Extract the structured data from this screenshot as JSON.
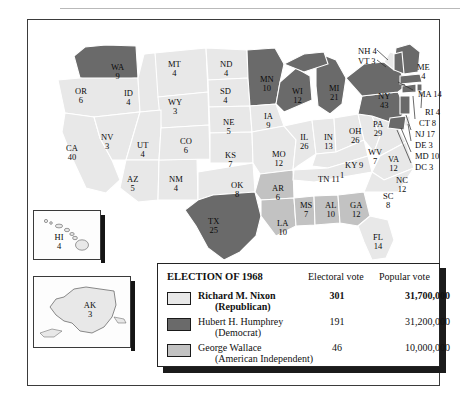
{
  "figure": {
    "frame_label": "election-map-1968"
  },
  "legend": {
    "title": "ELECTION OF 1968",
    "col_electoral": "Electoral vote",
    "col_popular": "Popular vote",
    "rows": [
      {
        "candidate": "Richard M. Nixon",
        "party": "(Republican)",
        "electoral": "301",
        "popular": "31,700,000",
        "color": "#e8e8e8",
        "bold": true
      },
      {
        "candidate": "Hubert H. Humphrey",
        "party": "(Democrat)",
        "electoral": "191",
        "popular": "31,200,000",
        "color": "#6a6a6a",
        "bold": false
      },
      {
        "candidate": "George Wallace",
        "party": "(American Independent)",
        "electoral": "46",
        "popular": "10,000,000",
        "color": "#c2c2c2",
        "bold": false
      }
    ]
  },
  "colors": {
    "nixon": "#e8e8e8",
    "humphrey": "#6a6a6a",
    "wallace": "#c2c2c2",
    "border": "#ffffff",
    "outline": "#2a2a2a"
  },
  "chart_data": {
    "type": "map",
    "title": "ELECTION OF 1968",
    "subtitle": "United States presidential election results by state",
    "legend_position": "bottom",
    "categories": [
      "Richard M. Nixon (Republican)",
      "Hubert H. Humphrey (Democrat)",
      "George Wallace (American Independent)"
    ],
    "totals": {
      "electoral": {
        "Nixon": 301,
        "Humphrey": 191,
        "Wallace": 46
      },
      "popular": {
        "Nixon": 31700000,
        "Humphrey": 31200000,
        "Wallace": 10000000
      }
    },
    "note_label": "1",
    "states": [
      {
        "code": "WA",
        "electoral": "9",
        "winner": "humphrey",
        "x": 83,
        "y": 43
      },
      {
        "code": "OR",
        "electoral": "6",
        "winner": "nixon",
        "x": 47,
        "y": 67
      },
      {
        "code": "CA",
        "electoral": "40",
        "winner": "nixon",
        "x": 38,
        "y": 124
      },
      {
        "code": "NV",
        "electoral": "3",
        "winner": "nixon",
        "x": 73,
        "y": 113
      },
      {
        "code": "ID",
        "electoral": "4",
        "winner": "nixon",
        "x": 96,
        "y": 69
      },
      {
        "code": "MT",
        "electoral": "4",
        "winner": "nixon",
        "x": 140,
        "y": 40
      },
      {
        "code": "WY",
        "electoral": "3",
        "winner": "nixon",
        "x": 140,
        "y": 78
      },
      {
        "code": "UT",
        "electoral": "4",
        "winner": "nixon",
        "x": 109,
        "y": 121
      },
      {
        "code": "AZ",
        "electoral": "5",
        "winner": "nixon",
        "x": 99,
        "y": 155
      },
      {
        "code": "NM",
        "electoral": "4",
        "winner": "nixon",
        "x": 141,
        "y": 155
      },
      {
        "code": "CO",
        "electoral": "6",
        "winner": "nixon",
        "x": 152,
        "y": 117
      },
      {
        "code": "ND",
        "electoral": "4",
        "winner": "nixon",
        "x": 192,
        "y": 40
      },
      {
        "code": "SD",
        "electoral": "4",
        "winner": "nixon",
        "x": 192,
        "y": 67
      },
      {
        "code": "NE",
        "electoral": "5",
        "winner": "nixon",
        "x": 195,
        "y": 98
      },
      {
        "code": "KS",
        "electoral": "7",
        "winner": "nixon",
        "x": 197,
        "y": 131
      },
      {
        "code": "OK",
        "electoral": "8",
        "winner": "nixon",
        "x": 203,
        "y": 161
      },
      {
        "code": "TX",
        "electoral": "25",
        "winner": "humphrey",
        "x": 180,
        "y": 197
      },
      {
        "code": "MN",
        "electoral": "10",
        "winner": "humphrey",
        "x": 232,
        "y": 55
      },
      {
        "code": "IA",
        "electoral": "9",
        "winner": "nixon",
        "x": 236,
        "y": 92
      },
      {
        "code": "MO",
        "electoral": "12",
        "winner": "nixon",
        "x": 244,
        "y": 130
      },
      {
        "code": "AR",
        "electoral": "6",
        "winner": "wallace",
        "x": 244,
        "y": 164
      },
      {
        "code": "LA",
        "electoral": "10",
        "winner": "wallace",
        "x": 249,
        "y": 199
      },
      {
        "code": "WI",
        "electoral": "12",
        "winner": "humphrey",
        "x": 264,
        "y": 67
      },
      {
        "code": "IL",
        "electoral": "26",
        "winner": "nixon",
        "x": 272,
        "y": 113
      },
      {
        "code": "IN",
        "electoral": "13",
        "winner": "nixon",
        "x": 296,
        "y": 113
      },
      {
        "code": "MS",
        "electoral": "7",
        "winner": "wallace",
        "x": 272,
        "y": 181
      },
      {
        "code": "AL",
        "electoral": "10",
        "winner": "wallace",
        "x": 297,
        "y": 181
      },
      {
        "code": "GA",
        "electoral": "12",
        "winner": "wallace",
        "x": 322,
        "y": 181
      },
      {
        "code": "MI",
        "electoral": "21",
        "winner": "humphrey",
        "x": 301,
        "y": 64
      },
      {
        "code": "OH",
        "electoral": "26",
        "winner": "nixon",
        "x": 321,
        "y": 107
      },
      {
        "code": "KY",
        "electoral": "9",
        "winner": "nixon",
        "x": 317,
        "y": 141,
        "inline": true
      },
      {
        "code": "TN",
        "electoral": "11",
        "winner": "nixon",
        "x": 290,
        "y": 155,
        "inline": true
      },
      {
        "code": "WV",
        "electoral": "7",
        "winner": "nixon",
        "x": 340,
        "y": 128
      },
      {
        "code": "VA",
        "electoral": "12",
        "winner": "nixon",
        "x": 360,
        "y": 135
      },
      {
        "code": "NC",
        "electoral": "12",
        "winner": "nixon",
        "x": 368,
        "y": 156
      },
      {
        "code": "SC",
        "electoral": "8",
        "winner": "nixon",
        "x": 355,
        "y": 172
      },
      {
        "code": "FL",
        "electoral": "14",
        "winner": "nixon",
        "x": 345,
        "y": 213
      },
      {
        "code": "PA",
        "electoral": "29",
        "winner": "humphrey",
        "x": 345,
        "y": 100
      },
      {
        "code": "NY",
        "electoral": "43",
        "winner": "humphrey",
        "x": 350,
        "y": 72
      },
      {
        "code": "ME",
        "electoral": "4",
        "winner": "humphrey",
        "x": 389,
        "y": 43
      }
    ],
    "callouts": [
      {
        "code": "NH",
        "electoral": "4",
        "winner": "humphrey",
        "x": 330,
        "y": 27
      },
      {
        "code": "VT",
        "electoral": "3",
        "winner": "nixon",
        "x": 330,
        "y": 37
      },
      {
        "code": "MA",
        "electoral": "14",
        "winner": "humphrey",
        "x": 390,
        "y": 70
      },
      {
        "code": "RI",
        "electoral": "4",
        "winner": "humphrey",
        "x": 397,
        "y": 88
      },
      {
        "code": "CT",
        "electoral": "8",
        "winner": "humphrey",
        "x": 391,
        "y": 99
      },
      {
        "code": "NJ",
        "electoral": "17",
        "winner": "humphrey",
        "x": 387,
        "y": 110
      },
      {
        "code": "DE",
        "electoral": "3",
        "winner": "nixon",
        "x": 387,
        "y": 121
      },
      {
        "code": "MD",
        "electoral": "10",
        "winner": "humphrey",
        "x": 387,
        "y": 132
      },
      {
        "code": "DC",
        "electoral": "3",
        "winner": "humphrey",
        "x": 387,
        "y": 143
      }
    ],
    "insets": [
      {
        "code": "HI",
        "electoral": "4",
        "winner": "nixon",
        "name": "hawaii-inset"
      },
      {
        "code": "AK",
        "electoral": "3",
        "winner": "nixon",
        "name": "alaska-inset"
      }
    ]
  }
}
